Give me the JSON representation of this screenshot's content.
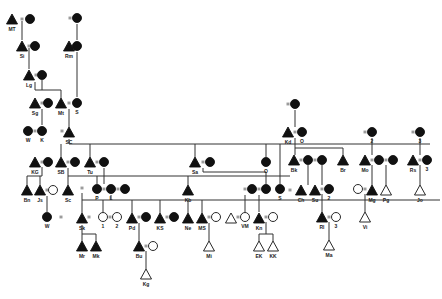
{
  "diagram": {
    "type": "kinship-genealogy",
    "colors": {
      "line": "#333333",
      "fill": "#111111",
      "background": "#ffffff"
    },
    "legend": {
      "filled_triangle": "male",
      "filled_circle": "female",
      "open_triangle": "male (open)",
      "open_circle": "female (open)",
      "equals": "marriage"
    },
    "nodes": [
      {
        "id": "MT",
        "shape": "tri",
        "fill": true,
        "x": 12,
        "y": 20,
        "label": "MT"
      },
      {
        "id": "MTw",
        "shape": "cir",
        "fill": true,
        "x": 30,
        "y": 19,
        "label": ""
      },
      {
        "id": "Si",
        "shape": "tri",
        "fill": true,
        "x": 22,
        "y": 47,
        "label": "Si"
      },
      {
        "id": "Siw",
        "shape": "cir",
        "fill": true,
        "x": 35,
        "y": 46,
        "label": ""
      },
      {
        "id": "Lg",
        "shape": "tri",
        "fill": true,
        "x": 29,
        "y": 76,
        "label": "Lg"
      },
      {
        "id": "Lgw",
        "shape": "cir",
        "fill": true,
        "x": 42,
        "y": 75,
        "label": ""
      },
      {
        "id": "Rmm",
        "shape": "cir",
        "fill": true,
        "x": 77,
        "y": 18,
        "label": ""
      },
      {
        "id": "Rm",
        "shape": "tri",
        "fill": true,
        "x": 69,
        "y": 47,
        "label": "Rm"
      },
      {
        "id": "Rmw",
        "shape": "cir",
        "fill": true,
        "x": 77,
        "y": 46,
        "label": ""
      },
      {
        "id": "Sg",
        "shape": "tri",
        "fill": true,
        "x": 35,
        "y": 104,
        "label": "Sg"
      },
      {
        "id": "Sgw",
        "shape": "cir",
        "fill": true,
        "x": 48,
        "y": 103,
        "label": ""
      },
      {
        "id": "Mt",
        "shape": "tri",
        "fill": true,
        "x": 61,
        "y": 104,
        "label": "Mt"
      },
      {
        "id": "S",
        "shape": "cir",
        "fill": true,
        "x": 77,
        "y": 103,
        "label": "S"
      },
      {
        "id": "W",
        "shape": "cir",
        "fill": true,
        "x": 28,
        "y": 131,
        "label": "W"
      },
      {
        "id": "K",
        "shape": "cir",
        "fill": true,
        "x": 42,
        "y": 131,
        "label": "K"
      },
      {
        "id": "SC",
        "shape": "tri",
        "fill": true,
        "x": 69,
        "y": 133,
        "label": "SC"
      },
      {
        "id": "KG",
        "shape": "tri",
        "fill": true,
        "x": 35,
        "y": 163,
        "label": "KG"
      },
      {
        "id": "KGw",
        "shape": "cir",
        "fill": true,
        "x": 48,
        "y": 162,
        "label": ""
      },
      {
        "id": "SB",
        "shape": "tri",
        "fill": true,
        "x": 61,
        "y": 163,
        "label": "SB"
      },
      {
        "id": "SBw",
        "shape": "cir",
        "fill": true,
        "x": 75,
        "y": 162,
        "label": ""
      },
      {
        "id": "Tu",
        "shape": "tri",
        "fill": true,
        "x": 90,
        "y": 163,
        "label": "Tu"
      },
      {
        "id": "Tuw",
        "shape": "cir",
        "fill": true,
        "x": 104,
        "y": 162,
        "label": ""
      },
      {
        "id": "Sa",
        "shape": "tri",
        "fill": true,
        "x": 195,
        "y": 163,
        "label": "Sa"
      },
      {
        "id": "Saw",
        "shape": "cir",
        "fill": true,
        "x": 210,
        "y": 162,
        "label": ""
      },
      {
        "id": "O",
        "shape": "cir",
        "fill": true,
        "x": 266,
        "y": 162,
        "label": "O"
      },
      {
        "id": "Kd",
        "shape": "tri",
        "fill": true,
        "x": 288,
        "y": 133,
        "label": "Kd"
      },
      {
        "id": "Kdm",
        "shape": "cir",
        "fill": true,
        "x": 295,
        "y": 104,
        "label": ""
      },
      {
        "id": "Od",
        "shape": "cir",
        "fill": true,
        "x": 302,
        "y": 132,
        "label": "O"
      },
      {
        "id": "Bk",
        "shape": "tri",
        "fill": true,
        "x": 294,
        "y": 161,
        "label": "Bk"
      },
      {
        "id": "Bkw1",
        "shape": "cir",
        "fill": true,
        "x": 308,
        "y": 160,
        "label": ""
      },
      {
        "id": "Bkw2",
        "shape": "cir",
        "fill": true,
        "x": 322,
        "y": 160,
        "label": ""
      },
      {
        "id": "Br",
        "shape": "tri",
        "fill": true,
        "x": 343,
        "y": 161,
        "label": "Br"
      },
      {
        "id": "Mo2",
        "shape": "cir",
        "fill": true,
        "x": 372,
        "y": 132,
        "label": "2"
      },
      {
        "id": "Mo",
        "shape": "tri",
        "fill": true,
        "x": 365,
        "y": 161,
        "label": "Mo"
      },
      {
        "id": "Mow1",
        "shape": "cir",
        "fill": true,
        "x": 379,
        "y": 160,
        "label": ""
      },
      {
        "id": "Mow2",
        "shape": "cir",
        "fill": true,
        "x": 393,
        "y": 160,
        "label": ""
      },
      {
        "id": "Rs3",
        "shape": "cir",
        "fill": true,
        "x": 420,
        "y": 132,
        "label": "3"
      },
      {
        "id": "Rs",
        "shape": "tri",
        "fill": true,
        "x": 413,
        "y": 161,
        "label": "Rs"
      },
      {
        "id": "Rsw",
        "shape": "cir",
        "fill": true,
        "x": 427,
        "y": 160,
        "label": "3"
      },
      {
        "id": "Bn",
        "shape": "tri",
        "fill": true,
        "x": 27,
        "y": 191,
        "label": "Bn"
      },
      {
        "id": "Js",
        "shape": "tri",
        "fill": true,
        "x": 40,
        "y": 191,
        "label": "Js"
      },
      {
        "id": "Jsw",
        "shape": "cir",
        "fill": false,
        "x": 53,
        "y": 190,
        "label": ""
      },
      {
        "id": "Sc",
        "shape": "tri",
        "fill": true,
        "x": 68,
        "y": 191,
        "label": "Sc"
      },
      {
        "id": "P",
        "shape": "cir",
        "fill": true,
        "x": 97,
        "y": 189,
        "label": "P"
      },
      {
        "id": "L",
        "shape": "cir",
        "fill": true,
        "x": 111,
        "y": 189,
        "label": "L"
      },
      {
        "id": "Lw",
        "shape": "cir",
        "fill": true,
        "x": 125,
        "y": 189,
        "label": ""
      },
      {
        "id": "Kb",
        "shape": "tri",
        "fill": true,
        "x": 188,
        "y": 191,
        "label": "Kb"
      },
      {
        "id": "VMm",
        "shape": "cir",
        "fill": true,
        "x": 252,
        "y": 189,
        "label": ""
      },
      {
        "id": "Knm",
        "shape": "cir",
        "fill": true,
        "x": 266,
        "y": 189,
        "label": ""
      },
      {
        "id": "Sx",
        "shape": "cir",
        "fill": true,
        "x": 280,
        "y": 189,
        "label": "S"
      },
      {
        "id": "Ch",
        "shape": "tri",
        "fill": true,
        "x": 301,
        "y": 191,
        "label": "Ch"
      },
      {
        "id": "Su",
        "shape": "tri",
        "fill": true,
        "x": 315,
        "y": 191,
        "label": "Su"
      },
      {
        "id": "Suw",
        "shape": "cir",
        "fill": true,
        "x": 329,
        "y": 189,
        "label": "2"
      },
      {
        "id": "Mgw",
        "shape": "cir",
        "fill": false,
        "x": 358,
        "y": 189,
        "label": ""
      },
      {
        "id": "Mg",
        "shape": "tri",
        "fill": true,
        "x": 372,
        "y": 191,
        "label": "Mg"
      },
      {
        "id": "Pg",
        "shape": "tri",
        "fill": false,
        "x": 386,
        "y": 191,
        "label": "Pg"
      },
      {
        "id": "Jo",
        "shape": "tri",
        "fill": false,
        "x": 420,
        "y": 191,
        "label": "Jo"
      },
      {
        "id": "Wc",
        "shape": "cir",
        "fill": true,
        "x": 47,
        "y": 217,
        "label": "W"
      },
      {
        "id": "Sk",
        "shape": "tri",
        "fill": true,
        "x": 82,
        "y": 219,
        "label": "Sk"
      },
      {
        "id": "i1",
        "shape": "cir",
        "fill": false,
        "x": 103,
        "y": 217,
        "label": "1"
      },
      {
        "id": "i2",
        "shape": "cir",
        "fill": false,
        "x": 117,
        "y": 217,
        "label": "2"
      },
      {
        "id": "Pd",
        "shape": "tri",
        "fill": true,
        "x": 132,
        "y": 219,
        "label": "Pd"
      },
      {
        "id": "Pdw",
        "shape": "cir",
        "fill": true,
        "x": 146,
        "y": 217,
        "label": ""
      },
      {
        "id": "KS",
        "shape": "tri",
        "fill": true,
        "x": 160,
        "y": 219,
        "label": "KS"
      },
      {
        "id": "KSw",
        "shape": "cir",
        "fill": true,
        "x": 174,
        "y": 217,
        "label": ""
      },
      {
        "id": "Ne",
        "shape": "tri",
        "fill": true,
        "x": 188,
        "y": 219,
        "label": "Ne"
      },
      {
        "id": "MS",
        "shape": "tri",
        "fill": true,
        "x": 202,
        "y": 219,
        "label": "MS"
      },
      {
        "id": "MSw",
        "shape": "cir",
        "fill": false,
        "x": 216,
        "y": 217,
        "label": ""
      },
      {
        "id": "VMh",
        "shape": "tri",
        "fill": false,
        "x": 231,
        "y": 219,
        "label": ""
      },
      {
        "id": "VM",
        "shape": "cir",
        "fill": false,
        "x": 245,
        "y": 217,
        "label": "VM"
      },
      {
        "id": "Kn",
        "shape": "tri",
        "fill": true,
        "x": 259,
        "y": 219,
        "label": "Kn"
      },
      {
        "id": "Knw",
        "shape": "cir",
        "fill": false,
        "x": 273,
        "y": 217,
        "label": ""
      },
      {
        "id": "Rl",
        "shape": "tri",
        "fill": true,
        "x": 322,
        "y": 218,
        "label": "Rl"
      },
      {
        "id": "Rlw",
        "shape": "cir",
        "fill": false,
        "x": 336,
        "y": 217,
        "label": "3"
      },
      {
        "id": "Vi",
        "shape": "tri",
        "fill": false,
        "x": 365,
        "y": 218,
        "label": "Vi"
      },
      {
        "id": "Mr",
        "shape": "tri",
        "fill": true,
        "x": 82,
        "y": 247,
        "label": "Mr"
      },
      {
        "id": "Mk",
        "shape": "tri",
        "fill": true,
        "x": 96,
        "y": 247,
        "label": "Mk"
      },
      {
        "id": "Bu",
        "shape": "tri",
        "fill": true,
        "x": 139,
        "y": 247,
        "label": "Bu"
      },
      {
        "id": "Buw",
        "shape": "cir",
        "fill": false,
        "x": 153,
        "y": 246,
        "label": ""
      },
      {
        "id": "Mi",
        "shape": "tri",
        "fill": false,
        "x": 209,
        "y": 247,
        "label": "Mi"
      },
      {
        "id": "EK",
        "shape": "tri",
        "fill": false,
        "x": 259,
        "y": 247,
        "label": "EK"
      },
      {
        "id": "KK",
        "shape": "tri",
        "fill": false,
        "x": 273,
        "y": 247,
        "label": "KK"
      },
      {
        "id": "Ma",
        "shape": "tri",
        "fill": false,
        "x": 329,
        "y": 246,
        "label": "Ma"
      },
      {
        "id": "Kg",
        "shape": "tri",
        "fill": false,
        "x": 146,
        "y": 275,
        "label": "Kg"
      }
    ],
    "marriages": [
      {
        "x": 22,
        "y": 19
      },
      {
        "x": 29,
        "y": 46
      },
      {
        "x": 36,
        "y": 75
      },
      {
        "x": 70,
        "y": 18
      },
      {
        "x": 73,
        "y": 46
      },
      {
        "x": 42,
        "y": 103
      },
      {
        "x": 69,
        "y": 103
      },
      {
        "x": 35,
        "y": 131
      },
      {
        "x": 62,
        "y": 131
      },
      {
        "x": 42,
        "y": 162
      },
      {
        "x": 68,
        "y": 162
      },
      {
        "x": 97,
        "y": 162
      },
      {
        "x": 203,
        "y": 162
      },
      {
        "x": 288,
        "y": 104
      },
      {
        "x": 295,
        "y": 132
      },
      {
        "x": 301,
        "y": 160
      },
      {
        "x": 315,
        "y": 160
      },
      {
        "x": 365,
        "y": 132
      },
      {
        "x": 372,
        "y": 160
      },
      {
        "x": 386,
        "y": 160
      },
      {
        "x": 413,
        "y": 132
      },
      {
        "x": 420,
        "y": 160
      },
      {
        "x": 47,
        "y": 190
      },
      {
        "x": 82,
        "y": 188
      },
      {
        "x": 104,
        "y": 189
      },
      {
        "x": 118,
        "y": 189
      },
      {
        "x": 245,
        "y": 189
      },
      {
        "x": 259,
        "y": 189
      },
      {
        "x": 290,
        "y": 190
      },
      {
        "x": 322,
        "y": 189
      },
      {
        "x": 365,
        "y": 189
      },
      {
        "x": 61,
        "y": 217
      },
      {
        "x": 89,
        "y": 217
      },
      {
        "x": 110,
        "y": 217
      },
      {
        "x": 139,
        "y": 217
      },
      {
        "x": 167,
        "y": 217
      },
      {
        "x": 209,
        "y": 217
      },
      {
        "x": 238,
        "y": 217
      },
      {
        "x": 266,
        "y": 217
      },
      {
        "x": 329,
        "y": 217
      },
      {
        "x": 146,
        "y": 246
      }
    ],
    "lines": [
      [
        22,
        21,
        22,
        40
      ],
      [
        29,
        48,
        29,
        69
      ],
      [
        77,
        24,
        77,
        40
      ],
      [
        77,
        52,
        77,
        97
      ],
      [
        35,
        82,
        35,
        90
      ],
      [
        35,
        90,
        61,
        90
      ],
      [
        61,
        90,
        61,
        98
      ],
      [
        42,
        80,
        42,
        90
      ],
      [
        42,
        109,
        42,
        125
      ],
      [
        69,
        109,
        69,
        127
      ],
      [
        69,
        139,
        69,
        144
      ],
      [
        69,
        144,
        430,
        144
      ],
      [
        61,
        144,
        61,
        157
      ],
      [
        90,
        144,
        90,
        157
      ],
      [
        195,
        144,
        195,
        157
      ],
      [
        266,
        144,
        266,
        157
      ],
      [
        280,
        144,
        280,
        184
      ],
      [
        42,
        167,
        42,
        176
      ],
      [
        27,
        176,
        42,
        176
      ],
      [
        27,
        176,
        27,
        185
      ],
      [
        40,
        176,
        40,
        185
      ],
      [
        47,
        196,
        47,
        212
      ],
      [
        68,
        168,
        68,
        176
      ],
      [
        68,
        176,
        290,
        176
      ],
      [
        68,
        176,
        68,
        185
      ],
      [
        97,
        176,
        97,
        184
      ],
      [
        188,
        176,
        188,
        185
      ],
      [
        104,
        168,
        104,
        184
      ],
      [
        82,
        193,
        82,
        200
      ],
      [
        82,
        200,
        440,
        200
      ],
      [
        82,
        200,
        82,
        213
      ],
      [
        111,
        195,
        111,
        200
      ],
      [
        103,
        200,
        103,
        212
      ],
      [
        132,
        200,
        132,
        213
      ],
      [
        160,
        200,
        160,
        213
      ],
      [
        188,
        200,
        188,
        213
      ],
      [
        202,
        200,
        202,
        213
      ],
      [
        82,
        225,
        82,
        234
      ],
      [
        82,
        234,
        96,
        234
      ],
      [
        82,
        234,
        82,
        241
      ],
      [
        96,
        234,
        96,
        241
      ],
      [
        139,
        223,
        139,
        241
      ],
      [
        146,
        251,
        146,
        269
      ],
      [
        209,
        223,
        209,
        241
      ],
      [
        203,
        168,
        203,
        172
      ],
      [
        203,
        172,
        266,
        172
      ],
      [
        266,
        172,
        266,
        184
      ],
      [
        245,
        195,
        245,
        212
      ],
      [
        259,
        195,
        259,
        212
      ],
      [
        266,
        222,
        266,
        234
      ],
      [
        259,
        234,
        273,
        234
      ],
      [
        259,
        234,
        259,
        241
      ],
      [
        273,
        234,
        273,
        241
      ],
      [
        295,
        110,
        295,
        127
      ],
      [
        295,
        138,
        295,
        148
      ],
      [
        295,
        148,
        343,
        148
      ],
      [
        295,
        148,
        295,
        155
      ],
      [
        343,
        148,
        343,
        155
      ],
      [
        308,
        165,
        308,
        185
      ],
      [
        322,
        165,
        322,
        185
      ],
      [
        322,
        194,
        322,
        212
      ],
      [
        329,
        222,
        329,
        240
      ],
      [
        372,
        138,
        372,
        155
      ],
      [
        372,
        165,
        372,
        185
      ],
      [
        365,
        194,
        365,
        212
      ],
      [
        386,
        165,
        386,
        185
      ],
      [
        420,
        138,
        420,
        155
      ],
      [
        420,
        165,
        420,
        185
      ]
    ]
  }
}
